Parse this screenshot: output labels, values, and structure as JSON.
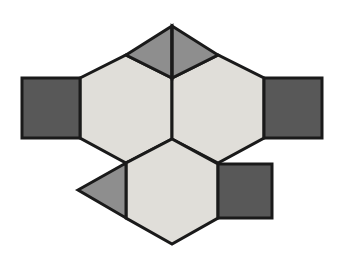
{
  "figure": {
    "background_color": "#ffffff",
    "canvas": {
      "width": 344,
      "height": 255
    },
    "stroke_color": "#1a1a1a",
    "stroke_width": 3,
    "palette": {
      "light_gray": "#e0ded9",
      "medium_gray": "#8e8e8e",
      "dark_gray": "#585858"
    },
    "shapes": [
      {
        "name": "hexagon-upper-left",
        "type": "hexagon",
        "fill": "#e0ded9",
        "points": "80,78 126,55 172,78 172,139 126,163 80,138"
      },
      {
        "name": "hexagon-upper-right",
        "type": "hexagon",
        "fill": "#e0ded9",
        "points": "172,78 218,55 264,78 264,138 218,163 172,139"
      },
      {
        "name": "hexagon-lower-center",
        "type": "hexagon",
        "fill": "#e0ded9",
        "points": "172,139 218,164 218,218 172,244 126,218 126,163"
      },
      {
        "name": "triangle-top-left",
        "type": "triangle",
        "fill": "#8e8e8e",
        "points": "126,55 172,26 172,78"
      },
      {
        "name": "triangle-top-right",
        "type": "triangle",
        "fill": "#8e8e8e",
        "points": "172,26 218,55 172,78"
      },
      {
        "name": "triangle-lower-left",
        "type": "triangle",
        "fill": "#8e8e8e",
        "points": "78,190 126,163 126,218"
      },
      {
        "name": "square-left",
        "type": "square",
        "fill": "#585858",
        "points": "22,78 80,78 80,138 22,138"
      },
      {
        "name": "square-right",
        "type": "square",
        "fill": "#585858",
        "points": "264,78 322,78 322,138 264,138"
      },
      {
        "name": "square-lower-right",
        "type": "square",
        "fill": "#585858",
        "points": "218,164 272,164 272,218 218,218"
      }
    ],
    "divider_lines": [
      {
        "name": "rhombus-vertical-divider",
        "x1": 172,
        "y1": 26,
        "x2": 172,
        "y2": 78
      }
    ]
  }
}
